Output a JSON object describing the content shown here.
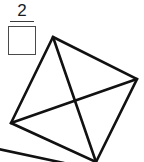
{
  "page": {
    "background_color": "#ffffff",
    "width": 144,
    "height": 162
  },
  "question": {
    "number_label": "2",
    "underline_color": "#3a3a3a"
  },
  "answer_box": {
    "value": "",
    "placeholder": "",
    "border_color": "#4a4a4a",
    "fill_color": "#ffffff"
  },
  "figure": {
    "name": "quadrilateral-with-diagonals",
    "stroke_color": "#111111",
    "fill_color": "none",
    "stroke_width": 2.6,
    "vertices": [
      {
        "name": "top",
        "x": 53,
        "y": 37
      },
      {
        "name": "right",
        "x": 137,
        "y": 79
      },
      {
        "name": "bottom",
        "x": 96,
        "y": 162
      },
      {
        "name": "left",
        "x": 11,
        "y": 123
      }
    ],
    "outline_path": "M53,37 L137,79 L96,162 L11,123 Z",
    "diagonals": [
      {
        "name": "diagonal-top-bottom",
        "from": "top",
        "to": "bottom",
        "path": "M53,37 L96,162"
      },
      {
        "name": "diagonal-left-right",
        "from": "left",
        "to": "right",
        "path": "M11,123 L137,79"
      }
    ],
    "diagonal_intersection": {
      "x": 73,
      "y": 103
    },
    "partial_edge": {
      "name": "cropped-line-bottom-left",
      "path": "M0,150 L62,162"
    }
  }
}
